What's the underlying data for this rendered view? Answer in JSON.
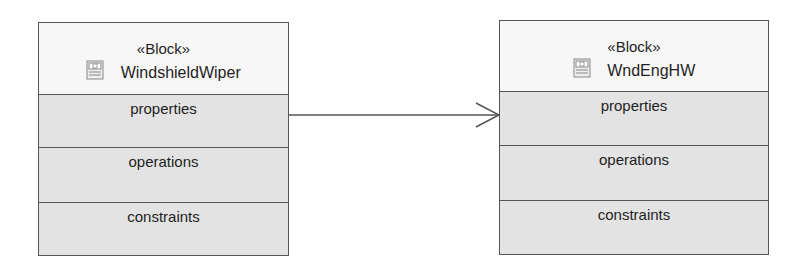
{
  "diagram": {
    "blocks": [
      {
        "stereotype": "«Block»",
        "icon": "block-icon",
        "name": "WindshieldWiper",
        "compartments": [
          "properties",
          "operations",
          "constraints"
        ]
      },
      {
        "stereotype": "«Block»",
        "icon": "block-icon",
        "name": "WndEngHW",
        "compartments": [
          "properties",
          "operations",
          "constraints"
        ]
      }
    ],
    "connectors": [
      {
        "from": "WindshieldWiper",
        "to": "WndEngHW",
        "type": "directed-association",
        "arrowhead": "open"
      }
    ],
    "colors": {
      "border": "#555555",
      "header_bg": "#f7f7f7",
      "compartment_bg": "#e3e3e3",
      "line": "#555555"
    }
  }
}
